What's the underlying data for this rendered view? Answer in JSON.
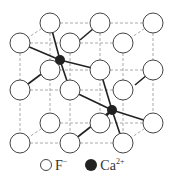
{
  "diagram": {
    "fluoride_positions": [
      [
        50,
        23
      ],
      [
        100,
        23
      ],
      [
        153,
        23
      ],
      [
        50,
        70
      ],
      [
        100,
        70
      ],
      [
        153,
        70
      ],
      [
        50,
        123
      ],
      [
        100,
        123
      ],
      [
        153,
        123
      ],
      [
        20,
        43
      ],
      [
        70,
        43
      ],
      [
        123,
        43
      ],
      [
        20,
        90
      ],
      [
        70,
        90
      ],
      [
        123,
        90
      ],
      [
        20,
        143
      ],
      [
        70,
        143
      ],
      [
        123,
        143
      ]
    ],
    "calcium_positions": [
      [
        60,
        60
      ],
      [
        112,
        110
      ]
    ],
    "legend": {
      "fluoride_label": "F",
      "fluoride_charge": "−",
      "calcium_label": "Ca",
      "calcium_charge": "2+"
    },
    "colors": {
      "circle_stroke": "#444444",
      "bond": "#222222",
      "grid": "#aaaaaa",
      "ion": "#222222"
    }
  }
}
